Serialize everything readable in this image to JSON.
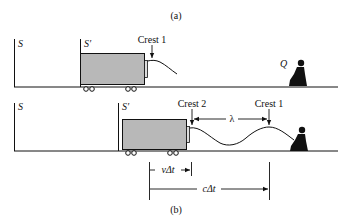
{
  "figure": {
    "panel_a": {
      "label": "(a)",
      "frame_S": "S",
      "frame_S_prime": "S′",
      "crest_label": "Crest 1",
      "observer_label": "Q"
    },
    "panel_b": {
      "label": "(b)",
      "frame_S": "S",
      "frame_S_prime": "S′",
      "crest2_label": "Crest 2",
      "crest1_label": "Crest 1",
      "wavelength_label": "λ",
      "source_displacement_label": "vΔt",
      "wave_displacement_label": "cΔt"
    },
    "colors": {
      "truck_fill": "#b8b8b8",
      "line": "#111111",
      "background": "#ffffff"
    }
  }
}
